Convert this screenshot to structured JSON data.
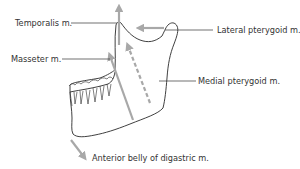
{
  "labels": {
    "temporalis": "Temporalis m.",
    "masseter": "Masseter m.",
    "lateral_pterygoid": "Lateral pterygoid m.",
    "medial_pterygoid": "Medial pterygoid m.",
    "anterior_digastric": "Anterior belly of digastric m."
  },
  "colors": {
    "outline": "#2a2a2a",
    "arrow": "#a8a8a8",
    "leader": "#333333",
    "text": "#333333"
  }
}
